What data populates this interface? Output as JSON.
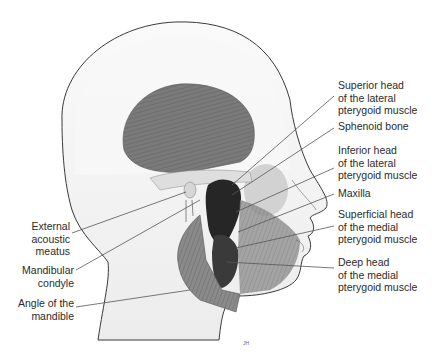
{
  "figure": {
    "labels_right": [
      {
        "id": "superior-head-lateral-pterygoid",
        "lines": [
          "Superior head",
          "of the lateral",
          "pterygoid muscle"
        ]
      },
      {
        "id": "sphenoid-bone",
        "lines": [
          "Sphenoid bone"
        ]
      },
      {
        "id": "inferior-head-lateral-pterygoid",
        "lines": [
          "Inferior head",
          "of the lateral",
          "pterygoid muscle"
        ]
      },
      {
        "id": "maxilla",
        "lines": [
          "Maxilla"
        ]
      },
      {
        "id": "superficial-head-medial-pterygoid",
        "lines": [
          "Superficial head",
          "of the medial",
          "pterygoid muscle"
        ]
      },
      {
        "id": "deep-head-medial-pterygoid",
        "lines": [
          "Deep head",
          "of the medial",
          "pterygoid muscle"
        ]
      }
    ],
    "labels_left": [
      {
        "id": "external-acoustic-meatus",
        "lines": [
          "External",
          "acoustic",
          "meatus"
        ]
      },
      {
        "id": "mandibular-condyle",
        "lines": [
          "Mandibular",
          "condyle"
        ]
      },
      {
        "id": "angle-of-mandible",
        "lines": [
          "Angle of the",
          "mandible"
        ]
      }
    ],
    "signature": "JH",
    "colors": {
      "outline": "#3a3a3a",
      "skin": "#f4f4f4",
      "muscle": "#7d7d7d",
      "muscle_dark": "#2a2a2a",
      "bone": "#e6e6e6",
      "label_text": "#2b2b2b",
      "leader_line": "#555555"
    }
  }
}
